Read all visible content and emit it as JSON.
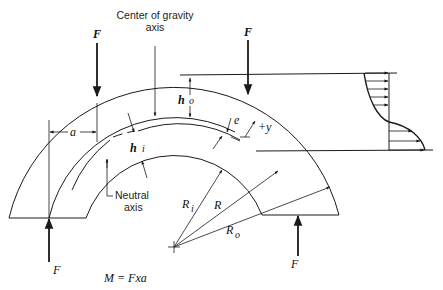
{
  "diagram": {
    "labels": {
      "cg_axis_line1": "Center of gravity",
      "cg_axis_line2": "axis",
      "neutral_line1": "Neutral",
      "neutral_line2": "axis",
      "force_top_left": "F",
      "force_top_right": "F",
      "force_bottom_left": "F",
      "force_bottom_right": "F",
      "a": "a",
      "ho_h": "h",
      "ho_sub": "o",
      "hi_h": "h",
      "hi_sub": "i",
      "e": "e",
      "plus_y": "+y",
      "Ri_R": "R",
      "Ri_sub": "i",
      "R": "R",
      "Ro_R": "R",
      "Ro_sub": "o",
      "moment": "M = Fxa"
    },
    "geometry": {
      "center": [
        174,
        247
      ],
      "outer_radius": 170,
      "centroid_radius": 130,
      "neutral_radius": 121,
      "inner_radius": 94
    },
    "stress_distribution": {
      "description": "Hyperbolic bending stress distribution across section",
      "arrow_count_top": 5,
      "arrow_count_bottom": 3
    },
    "colors": {
      "line": "#1a1a1a",
      "background": "#ffffff"
    }
  }
}
